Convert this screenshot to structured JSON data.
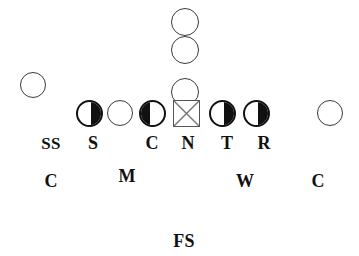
{
  "diagram": {
    "canvas": {
      "width": 359,
      "height": 256,
      "background": "#ffffff"
    },
    "colors": {
      "fill_dark": "#111111",
      "outline_dark": "#111111",
      "outline_light": "#3a3a3a",
      "square_outline": "#555555",
      "square_cross": "#777777",
      "label_text": "#111111"
    },
    "markers": [
      {
        "id": "receiver-top-1",
        "shape": "circle-open",
        "x": 185,
        "y": 22,
        "size": 28
      },
      {
        "id": "receiver-top-2",
        "shape": "circle-open",
        "x": 185,
        "y": 50,
        "size": 28
      },
      {
        "id": "receiver-slot",
        "shape": "circle-open",
        "x": 185,
        "y": 92,
        "size": 28
      },
      {
        "id": "wide-left",
        "shape": "circle-open",
        "x": 33,
        "y": 85,
        "size": 26
      },
      {
        "id": "lineman-s",
        "shape": "circle-half-right",
        "x": 89,
        "y": 113,
        "size": 27
      },
      {
        "id": "lineman-open",
        "shape": "circle-open",
        "x": 120,
        "y": 113,
        "size": 26
      },
      {
        "id": "lineman-c",
        "shape": "circle-half-left",
        "x": 152,
        "y": 113,
        "size": 27
      },
      {
        "id": "lineman-n",
        "shape": "square-x",
        "x": 186,
        "y": 113,
        "size": 27
      },
      {
        "id": "lineman-t",
        "shape": "circle-half-right",
        "x": 222,
        "y": 113,
        "size": 27
      },
      {
        "id": "lineman-r",
        "shape": "circle-half-right",
        "x": 256,
        "y": 113,
        "size": 27
      },
      {
        "id": "wide-right",
        "shape": "circle-open",
        "x": 330,
        "y": 113,
        "size": 26
      }
    ],
    "labels": [
      {
        "id": "label-ss",
        "text": "SS",
        "x": 51,
        "y": 135,
        "size": 17
      },
      {
        "id": "label-s",
        "text": "S",
        "x": 93,
        "y": 134,
        "size": 18
      },
      {
        "id": "label-c-line",
        "text": "C",
        "x": 152,
        "y": 134,
        "size": 18
      },
      {
        "id": "label-n",
        "text": "N",
        "x": 188,
        "y": 134,
        "size": 18
      },
      {
        "id": "label-t",
        "text": "T",
        "x": 227,
        "y": 134,
        "size": 18
      },
      {
        "id": "label-r",
        "text": "R",
        "x": 264,
        "y": 134,
        "size": 18
      },
      {
        "id": "label-c-left",
        "text": "C",
        "x": 51,
        "y": 172,
        "size": 18
      },
      {
        "id": "label-m",
        "text": "M",
        "x": 127,
        "y": 167,
        "size": 18
      },
      {
        "id": "label-w",
        "text": "W",
        "x": 245,
        "y": 172,
        "size": 18
      },
      {
        "id": "label-c-right",
        "text": "C",
        "x": 318,
        "y": 172,
        "size": 18
      },
      {
        "id": "label-fs",
        "text": "FS",
        "x": 184,
        "y": 232,
        "size": 18
      }
    ]
  }
}
